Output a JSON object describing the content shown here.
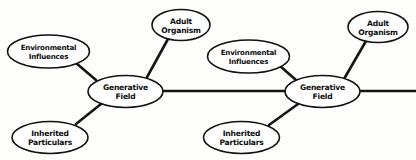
{
  "diagram": {
    "style": {
      "background_color": "#fdfdfb",
      "stroke_color": "#111111",
      "node_fill": "#ffffff",
      "text_color": "#0d0d0d"
    },
    "nodes": [
      {
        "id": "env-influences-1",
        "name": "environmental-influences-node-1",
        "line1": "Environmental",
        "line2": "Influences",
        "cx": 48.5,
        "cy": 51.5,
        "rx": 41,
        "ry": 16.5,
        "size": "sm"
      },
      {
        "id": "adult-organism-1",
        "name": "adult-organism-node-1",
        "line1": "Adult",
        "line2": "Organism",
        "cx": 181,
        "cy": 25,
        "rx": 29,
        "ry": 15.5,
        "size": "md"
      },
      {
        "id": "generative-field-1",
        "name": "generative-field-node-1",
        "line1": "Generative",
        "line2": "Field",
        "cx": 125.5,
        "cy": 91.5,
        "rx": 37.5,
        "ry": 16,
        "size": "md"
      },
      {
        "id": "inherited-particulars-1",
        "name": "inherited-particulars-node-1",
        "line1": "Inherited",
        "line2": "Particulars",
        "cx": 50,
        "cy": 137.5,
        "rx": 38,
        "ry": 16,
        "size": "md"
      },
      {
        "id": "env-influences-2",
        "name": "environmental-influences-node-2",
        "line1": "Environmental",
        "line2": "Influences",
        "cx": 248.5,
        "cy": 56.5,
        "rx": 41,
        "ry": 16.5,
        "size": "sm"
      },
      {
        "id": "adult-organism-2",
        "name": "adult-organism-node-2",
        "line1": "Adult",
        "line2": "Organism",
        "cx": 378,
        "cy": 27,
        "rx": 30,
        "ry": 15.5,
        "size": "md"
      },
      {
        "id": "generative-field-2",
        "name": "generative-field-node-2",
        "line1": "Generative",
        "line2": "Field",
        "cx": 322.5,
        "cy": 91.5,
        "rx": 37.5,
        "ry": 16,
        "size": "md"
      },
      {
        "id": "inherited-particulars-2",
        "name": "inherited-particulars-node-2",
        "line1": "Inherited",
        "line2": "Particulars",
        "cx": 241.5,
        "cy": 137.5,
        "rx": 38,
        "ry": 16,
        "size": "md"
      }
    ],
    "edges": [
      {
        "id": "e1",
        "name": "edge-env1-to-field1",
        "x1": 76,
        "y1": 63,
        "x2": 96,
        "y2": 80,
        "width": 2.6
      },
      {
        "id": "e2",
        "name": "edge-field1-to-adult1",
        "x1": 146,
        "y1": 79,
        "x2": 168,
        "y2": 39,
        "width": 2.6
      },
      {
        "id": "e3",
        "name": "edge-inherited1-to-field1",
        "x1": 76,
        "y1": 124,
        "x2": 101,
        "y2": 104,
        "width": 2.6
      },
      {
        "id": "e4",
        "name": "edge-field1-to-field2",
        "x1": 163,
        "y1": 91,
        "x2": 285,
        "y2": 91,
        "width": 2.4
      },
      {
        "id": "e5",
        "name": "edge-env2-to-field2",
        "x1": 280,
        "y1": 66,
        "x2": 296,
        "y2": 80,
        "width": 2.6
      },
      {
        "id": "e6",
        "name": "edge-field2-to-adult2",
        "x1": 344,
        "y1": 79,
        "x2": 366,
        "y2": 41,
        "width": 2.6
      },
      {
        "id": "e7",
        "name": "edge-inherited2-to-field2",
        "x1": 269,
        "y1": 125,
        "x2": 298,
        "y2": 104,
        "width": 2.6
      },
      {
        "id": "e8",
        "name": "edge-field2-to-right-edge",
        "x1": 360,
        "y1": 91,
        "x2": 416,
        "y2": 91,
        "width": 2.4
      }
    ]
  }
}
